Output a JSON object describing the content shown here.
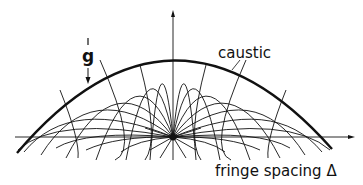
{
  "diagram": {
    "type": "trajectory-caustic",
    "labels": {
      "gravity": "g",
      "caustic": "caustic",
      "x_axis": "fringe spacing Δ"
    },
    "elements": {
      "vertical_axis": "up-arrow",
      "horizontal_axis": "right-arrow",
      "gravity_arrow": "down-arrow",
      "source_point": "origin-pole"
    },
    "colors": {
      "ink": "#111111",
      "background": "#ffffff"
    }
  }
}
